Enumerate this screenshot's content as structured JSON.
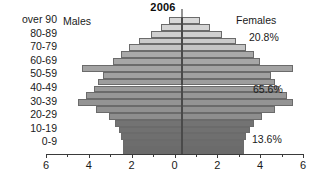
{
  "chart_data": {
    "type": "bar",
    "subtype": "population-pyramid",
    "title": "2006",
    "xlabel": "",
    "ylabel": "",
    "xlim": [
      -6,
      6
    ],
    "grid": false,
    "legend_position": "inline-headers",
    "axis_ticks": [
      {
        "label": "6",
        "value": -6
      },
      {
        "label": "4",
        "value": -4
      },
      {
        "label": "2",
        "value": -2
      },
      {
        "label": "0",
        "value": 0
      },
      {
        "label": "2",
        "value": 2
      },
      {
        "label": "4",
        "value": 4
      },
      {
        "label": "6",
        "value": 6
      }
    ],
    "minor_ticks": [
      -5,
      -3,
      -1,
      1,
      3,
      5
    ],
    "side_labels": {
      "left": "Males",
      "right": "Females"
    },
    "y_axis_labels": [
      "over 90",
      "80-89",
      "70-79",
      "60-69",
      "50-59",
      "40-49",
      "30-39",
      "20-29",
      "10-19",
      "0-9"
    ],
    "categories": [
      "over 90",
      "85-89",
      "80-84",
      "75-79",
      "70-74",
      "65-69",
      "60-64",
      "55-59",
      "50-54",
      "45-49",
      "40-44",
      "35-39",
      "30-34",
      "25-29",
      "20-24",
      "15-19",
      "10-14",
      "5-9",
      "0-4",
      "under 1"
    ],
    "series": [
      {
        "name": "Males",
        "values": [
          0.6,
          1.0,
          1.5,
          2.1,
          2.6,
          3.0,
          3.4,
          4.9,
          3.9,
          4.1,
          4.3,
          4.7,
          5.1,
          4.2,
          3.6,
          3.3,
          3.1,
          3.0,
          2.9,
          2.9
        ]
      },
      {
        "name": "Females",
        "values": [
          0.9,
          1.4,
          2.0,
          2.7,
          3.2,
          3.6,
          3.9,
          5.5,
          4.4,
          4.6,
          4.8,
          5.2,
          5.5,
          4.6,
          4.0,
          3.6,
          3.4,
          3.2,
          3.1,
          3.1
        ]
      }
    ],
    "shade_bands": [
      {
        "name": "elderly",
        "color": "#d2d2d2"
      },
      {
        "name": "working-age",
        "color": "#9d9d9d"
      },
      {
        "name": "youth",
        "color": "#6f6f6f"
      }
    ],
    "row_colors": [
      "#d8d8d8",
      "#d4d4d4",
      "#cfcfcf",
      "#cacaca",
      "#c4c4c4",
      "#a9a9a9",
      "#a6a6a6",
      "#a3a3a3",
      "#a0a0a0",
      "#9d9d9d",
      "#9a9a9a",
      "#979797",
      "#949494",
      "#919191",
      "#8e8e8e",
      "#737373",
      "#717171",
      "#6f6f6f",
      "#6d6d6d",
      "#6b6b6b"
    ],
    "annotations": [
      {
        "id": "top",
        "text": "20.8%",
        "refers_to": "share aged 60 and over"
      },
      {
        "id": "mid",
        "text": "65.6%",
        "refers_to": "share aged 20-59"
      },
      {
        "id": "bot",
        "text": "13.6%",
        "refers_to": "share aged 0-19"
      }
    ],
    "colors": {
      "bar_outline": "#6b6b6b",
      "axis": "#3a3a3a",
      "zero_line": "#2b2b2b",
      "text": "#1a1a1a",
      "background": "#ffffff"
    }
  }
}
